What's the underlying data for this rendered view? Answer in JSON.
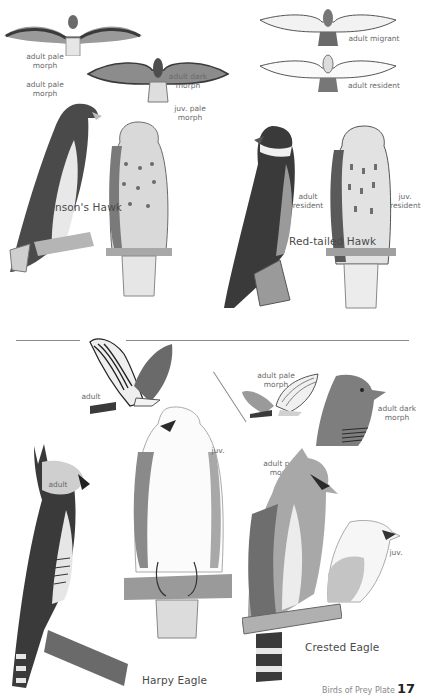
{
  "plate": {
    "section_top": {
      "swainsons_hawk": {
        "name": "Swainson's Hawk",
        "labels": {
          "flight_pale": "adult pale\nmorph",
          "flight_dark": "adult dark\nmorph",
          "perched_pale": "adult pale\nmorph",
          "perched_juv": "juv. pale\nmorph"
        }
      },
      "red_tailed_hawk": {
        "name": "Red-tailed Hawk",
        "labels": {
          "flight_migrant": "adult migrant",
          "flight_resident": "adult resident",
          "perched_adult": "adult\nresident",
          "perched_juv": "juv.\nresident"
        }
      }
    },
    "section_bottom": {
      "harpy_eagle": {
        "name": "Harpy Eagle",
        "labels": {
          "flight_adult": "adult",
          "perched_adult": "adult",
          "perched_juv": "juv."
        }
      },
      "crested_eagle": {
        "name": "Crested Eagle",
        "labels": {
          "flight_pale": "adult pale\nmorph",
          "head_dark": "adult dark\nmorph",
          "perched_pale": "adult pale\nmorph",
          "head_juv": "juv."
        }
      }
    },
    "footer": {
      "running_text": "Birds of Prey Plate",
      "page_number": "17"
    }
  },
  "colors": {
    "background": "#ffffff",
    "ink_dark": "#2e2e2e",
    "ink_mid": "#7a7a7a",
    "ink_light": "#c8c8c8",
    "label": "#6a6a6a",
    "rule": "#8a8a8a"
  }
}
